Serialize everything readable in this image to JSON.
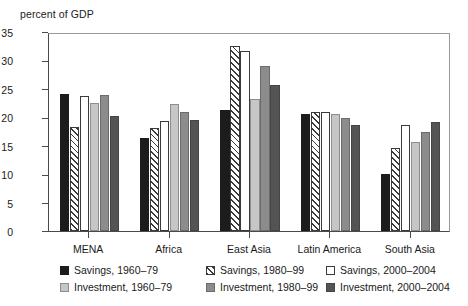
{
  "chart_data": {
    "type": "bar",
    "title": "",
    "ylabel": "percent of GDP",
    "xlabel": "",
    "ylim": [
      0,
      35
    ],
    "yticks": [
      0,
      5,
      10,
      15,
      20,
      25,
      30,
      35
    ],
    "grid": false,
    "legend_position": "bottom",
    "categories": [
      "MENA",
      "Africa",
      "East Asia",
      "Latin America",
      "South Asia"
    ],
    "series": [
      {
        "name": "Savings, 1960–79",
        "style": "solid-black",
        "color": "#1c1c1c",
        "values": [
          24.1,
          16.4,
          21.2,
          20.6,
          10.0
        ]
      },
      {
        "name": "Savings, 1980–99",
        "style": "hatched",
        "color": "#ffffff",
        "values": [
          18.3,
          18.2,
          32.6,
          20.9,
          14.6
        ]
      },
      {
        "name": "Savings, 2000–2004",
        "style": "open-white",
        "color": "#ffffff",
        "values": [
          23.7,
          19.4,
          31.7,
          20.9,
          18.6
        ]
      },
      {
        "name": "Investment, 1960–79",
        "style": "light-gray",
        "color": "#c6c6c6",
        "values": [
          22.6,
          22.3,
          23.3,
          20.5,
          15.7
        ]
      },
      {
        "name": "Investment, 1980–99",
        "style": "mid-gray",
        "color": "#8c8c8c",
        "values": [
          24.0,
          20.9,
          29.0,
          19.9,
          17.4
        ]
      },
      {
        "name": "Investment, 2000–2004",
        "style": "dark-gray",
        "color": "#545454",
        "values": [
          20.2,
          19.6,
          25.6,
          18.6,
          19.1
        ]
      }
    ]
  },
  "axis": {
    "y_title": "percent of GDP",
    "y_tick_labels": [
      "35",
      "30",
      "25",
      "20",
      "15",
      "10",
      "5",
      "0"
    ],
    "x_tick_labels": [
      "MENA",
      "Africa",
      "East Asia",
      "Latin America",
      "South Asia"
    ]
  },
  "legend": {
    "items": [
      {
        "label": "Savings, 1960–79",
        "swatch": "solid-black-swatch"
      },
      {
        "label": "Savings, 1980–99",
        "swatch": "hatched-swatch"
      },
      {
        "label": "Savings, 2000–2004",
        "swatch": "open-white-swatch"
      },
      {
        "label": "Investment, 1960–79",
        "swatch": "light-gray-swatch"
      },
      {
        "label": "Investment, 1980–99",
        "swatch": "mid-gray-swatch"
      },
      {
        "label": "Investment, 2000–2004",
        "swatch": "dark-gray-swatch"
      }
    ]
  }
}
